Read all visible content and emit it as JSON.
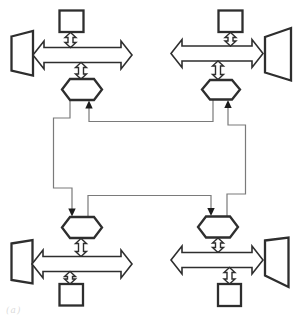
{
  "figure": {
    "type": "block-diagram-ring-bus",
    "caption_label": "(a)",
    "colors": {
      "background": "#ffffff",
      "shape_stroke": "#2e2e2e",
      "shape_fill": "#ffffff",
      "ring_stroke": "#7a7a7a",
      "arrowhead_fill": "#1c1c1c"
    },
    "clusters": [
      {
        "position": "top-left",
        "components": [
          "square-box",
          "trapezoid",
          "wide-double-arrow",
          "small-double-arrow-upper",
          "small-double-arrow-lower",
          "hexagon-interface"
        ]
      },
      {
        "position": "top-right",
        "components": [
          "square-box",
          "trapezoid",
          "wide-double-arrow",
          "small-double-arrow-upper",
          "small-double-arrow-lower",
          "hexagon-interface"
        ]
      },
      {
        "position": "bottom-left",
        "components": [
          "square-box",
          "trapezoid",
          "wide-double-arrow",
          "small-double-arrow-upper",
          "small-double-arrow-lower",
          "hexagon-interface"
        ]
      },
      {
        "position": "bottom-right",
        "components": [
          "square-box",
          "trapezoid",
          "wide-double-arrow",
          "small-double-arrow-upper",
          "small-double-arrow-lower",
          "hexagon-interface"
        ]
      }
    ],
    "ring_bus": {
      "shape": "rectangular-loop",
      "segments": 4,
      "arrowheads_into_hexagons": 4,
      "flow": "counterclockwise"
    }
  }
}
